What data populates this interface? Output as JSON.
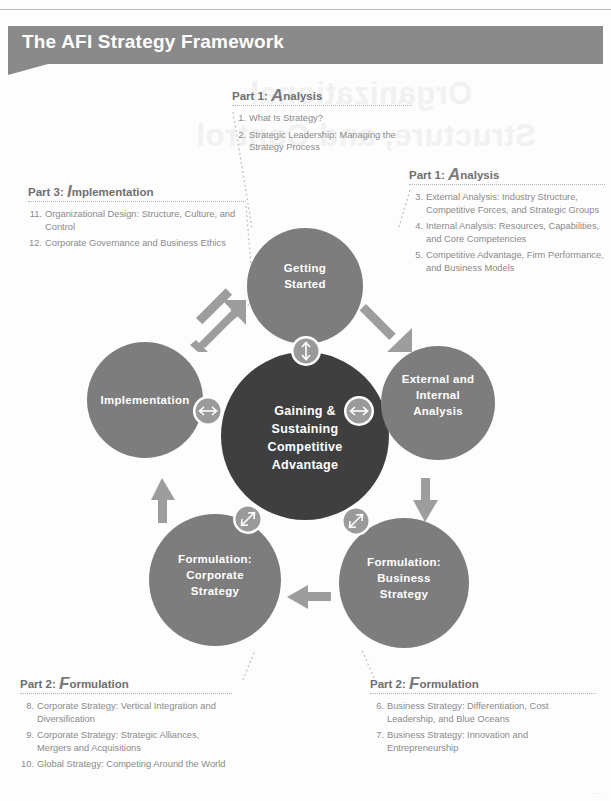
{
  "figure": {
    "title": "The AFI Strategy Framework",
    "ghost_line1": "Organizational",
    "ghost_line2": "Structure, and Control",
    "page_marker": "···"
  },
  "colors": {
    "banner": "#8a8a8a",
    "node_circle": "#7d7d7d",
    "core_circle": "#3f3f3f",
    "badge": "#9a9a9a",
    "arrow": "#9d9d9d",
    "text_body": "#8a8a8a",
    "text_heading": "#6f6f6f"
  },
  "nodes": [
    {
      "id": "getting-started",
      "label_lines": [
        "Getting",
        "Started"
      ]
    },
    {
      "id": "external-internal",
      "label_lines": [
        "External and",
        "Internal",
        "Analysis"
      ]
    },
    {
      "id": "formulation-business",
      "label_lines": [
        "Formulation:",
        "Business",
        "Strategy"
      ]
    },
    {
      "id": "formulation-corporate",
      "label_lines": [
        "Formulation:",
        "Corporate",
        "Strategy"
      ]
    },
    {
      "id": "implementation",
      "label_lines": [
        "Implementation"
      ]
    }
  ],
  "core": {
    "id": "core-circle",
    "label_lines": [
      "Gaining &",
      "Sustaining",
      "Competitive",
      "Advantage"
    ]
  },
  "badges": [
    {
      "id": "badge-top",
      "icon": "double-arrow-vertical-icon"
    },
    {
      "id": "badge-right",
      "icon": "double-arrow-horizontal-icon"
    },
    {
      "id": "badge-bottom-right",
      "icon": "double-arrow-diagonal-icon"
    },
    {
      "id": "badge-bottom-left",
      "icon": "double-arrow-diagonal-icon"
    },
    {
      "id": "badge-left",
      "icon": "double-arrow-horizontal-icon"
    }
  ],
  "flow_arrows": [
    {
      "id": "arrow-implementation-to-getting-started",
      "icon": "arrow-up-right-icon"
    },
    {
      "id": "arrow-getting-started-to-external",
      "icon": "arrow-down-right-icon"
    },
    {
      "id": "arrow-external-to-business",
      "icon": "arrow-down-icon"
    },
    {
      "id": "arrow-business-to-corporate",
      "icon": "arrow-left-icon"
    },
    {
      "id": "arrow-corporate-to-implementation",
      "icon": "arrow-up-icon"
    }
  ],
  "callouts": [
    {
      "id": "part1-top",
      "part": "Part 1:",
      "initial": "A",
      "word": "nalysis",
      "items": [
        {
          "num": "1.",
          "text": "What Is Strategy?"
        },
        {
          "num": "2.",
          "text": "Strategic Leadership: Managing the Strategy Process"
        }
      ]
    },
    {
      "id": "part1-right",
      "part": "Part 1:",
      "initial": "A",
      "word": "nalysis",
      "items": [
        {
          "num": "3.",
          "text": "External Analysis: Industry Structure, Competitive Forces, and Strategic Groups"
        },
        {
          "num": "4.",
          "text": "Internal Analysis: Resources, Capabilities, and Core Competencies"
        },
        {
          "num": "5.",
          "text": "Competitive Advantage, Firm Performance, and Business Models"
        }
      ]
    },
    {
      "id": "part3-left",
      "part": "Part 3:",
      "initial": "I",
      "word": "mplementation",
      "items": [
        {
          "num": "11.",
          "text": "Organizational Design: Structure, Culture, and Control"
        },
        {
          "num": "12.",
          "text": "Corporate Governance and Business Ethics"
        }
      ]
    },
    {
      "id": "part2-left",
      "part": "Part 2:",
      "initial": "F",
      "word": "ormulation",
      "items": [
        {
          "num": "8.",
          "text": "Corporate Strategy: Vertical Integration and Diversification"
        },
        {
          "num": "9.",
          "text": "Corporate Strategy: Strategic Alliances, Mergers and Acquisitions"
        },
        {
          "num": "10.",
          "text": "Global Strategy: Competing Around the World"
        }
      ]
    },
    {
      "id": "part2-right",
      "part": "Part 2:",
      "initial": "F",
      "word": "ormulation",
      "items": [
        {
          "num": "6.",
          "text": "Business Strategy: Differentiation, Cost Leadership, and Blue Oceans"
        },
        {
          "num": "7.",
          "text": "Business Strategy: Innovation and Entrepreneurship"
        }
      ]
    }
  ]
}
